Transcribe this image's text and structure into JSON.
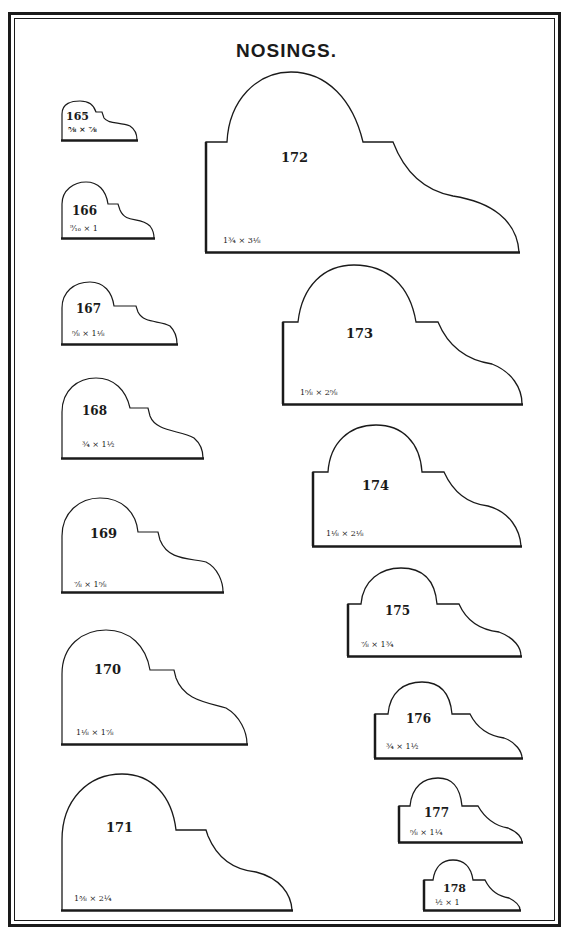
{
  "page": {
    "title": "NOSINGS.",
    "border_color": "#1a1a1a",
    "background": "#ffffff"
  },
  "profiles": [
    {
      "number": "165",
      "size": "⅝ × ⅞"
    },
    {
      "number": "166",
      "size": "⁹⁄₁₆ × 1"
    },
    {
      "number": "167",
      "size": "⅝ × 1⅛"
    },
    {
      "number": "168",
      "size": "¾ × 1½"
    },
    {
      "number": "169",
      "size": "⅞ × 1⅝"
    },
    {
      "number": "170",
      "size": "1⅛ × 1⅞"
    },
    {
      "number": "171",
      "size": "1⅜ × 2¼"
    },
    {
      "number": "172",
      "size": "1¾ × 3⅛"
    },
    {
      "number": "173",
      "size": "1⅝ × 2⅝"
    },
    {
      "number": "174",
      "size": "1⅛ × 2⅛"
    },
    {
      "number": "175",
      "size": "⅞ × 1¾"
    },
    {
      "number": "176",
      "size": "¾ × 1½"
    },
    {
      "number": "177",
      "size": "⅝ × 1¼"
    },
    {
      "number": "178",
      "size": "½ × 1"
    }
  ]
}
